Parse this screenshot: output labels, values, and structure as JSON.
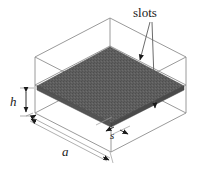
{
  "figure": {
    "type": "technical-diagram",
    "background_color": "#ffffff",
    "line_color": "#8a8a8a",
    "plate_color": "#5c5c5c",
    "text_color": "#1a1a1a"
  },
  "callouts": {
    "slots": "slots"
  },
  "dimensions": {
    "height": "h",
    "side": "a",
    "slot_spacing": "s"
  },
  "geometry": {
    "box": {
      "top_face": [
        [
          35,
          57
        ],
        [
          110,
          18
        ],
        [
          186,
          57
        ],
        [
          111,
          96
        ]
      ],
      "mid_face": [
        [
          35,
          85
        ],
        [
          110,
          46
        ],
        [
          186,
          85
        ],
        [
          111,
          124
        ]
      ],
      "bottom_face": [
        [
          35,
          113
        ],
        [
          110,
          74
        ],
        [
          186,
          113
        ],
        [
          111,
          152
        ]
      ]
    },
    "plate": [
      [
        37,
        86
      ],
      [
        110,
        47
      ],
      [
        184,
        86
      ],
      [
        111,
        123
      ]
    ]
  }
}
